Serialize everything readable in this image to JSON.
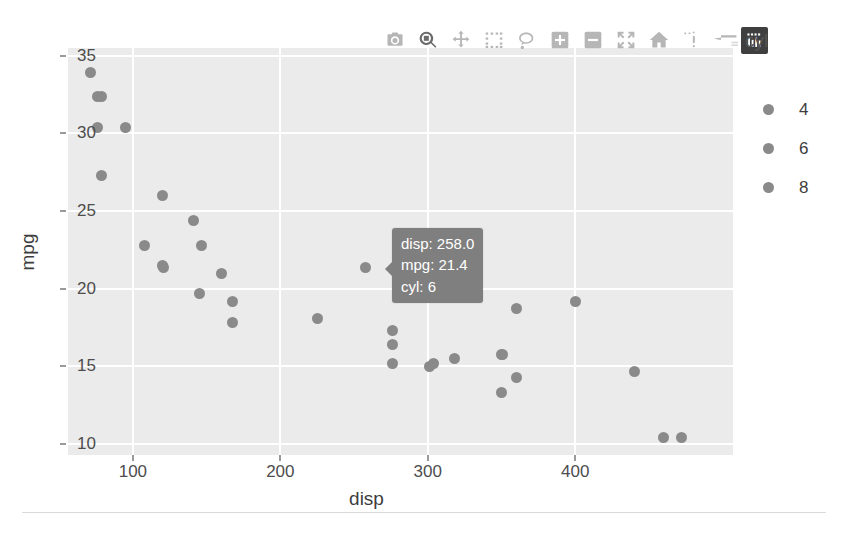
{
  "chart_data": {
    "type": "scatter",
    "title": "",
    "xlabel": "disp",
    "ylabel": "mpg",
    "xlim": [
      56.0,
      507.0
    ],
    "ylim": [
      9.3,
      35.5
    ],
    "xticks": [
      100,
      200,
      300,
      400
    ],
    "yticks": [
      10,
      15,
      20,
      25,
      30,
      35
    ],
    "grid": true,
    "legend_title": "cyl",
    "legend_position": "right",
    "legend_entries": [
      "4",
      "6",
      "8"
    ],
    "marker_color": "#8a8a8a",
    "plot_bg": "#ebebeb",
    "grid_color": "#ffffff",
    "series": [
      {
        "name": "4",
        "points": [
          {
            "disp": 71.1,
            "mpg": 33.9
          },
          {
            "disp": 75.7,
            "mpg": 32.4
          },
          {
            "disp": 78.7,
            "mpg": 32.4
          },
          {
            "disp": 79.0,
            "mpg": 27.3
          },
          {
            "disp": 95.1,
            "mpg": 30.4
          },
          {
            "disp": 120.1,
            "mpg": 21.5
          },
          {
            "disp": 120.3,
            "mpg": 26.0
          },
          {
            "disp": 121.0,
            "mpg": 21.4
          },
          {
            "disp": 140.8,
            "mpg": 24.4
          },
          {
            "disp": 146.7,
            "mpg": 22.8
          },
          {
            "disp": 108.0,
            "mpg": 22.8
          },
          {
            "disp": 75.7,
            "mpg": 30.4
          }
        ]
      },
      {
        "name": "6",
        "points": [
          {
            "disp": 160.0,
            "mpg": 21.0
          },
          {
            "disp": 167.6,
            "mpg": 19.2
          },
          {
            "disp": 167.6,
            "mpg": 17.8
          },
          {
            "disp": 145.0,
            "mpg": 19.7
          },
          {
            "disp": 225.0,
            "mpg": 18.1
          },
          {
            "disp": 258.0,
            "mpg": 21.4
          }
        ]
      },
      {
        "name": "8",
        "points": [
          {
            "disp": 275.8,
            "mpg": 17.3
          },
          {
            "disp": 275.8,
            "mpg": 16.4
          },
          {
            "disp": 275.8,
            "mpg": 15.2
          },
          {
            "disp": 301.0,
            "mpg": 15.0
          },
          {
            "disp": 304.0,
            "mpg": 15.2
          },
          {
            "disp": 318.0,
            "mpg": 15.5
          },
          {
            "disp": 350.0,
            "mpg": 15.8
          },
          {
            "disp": 351.0,
            "mpg": 15.8
          },
          {
            "disp": 350.0,
            "mpg": 13.3
          },
          {
            "disp": 360.0,
            "mpg": 14.3
          },
          {
            "disp": 360.0,
            "mpg": 18.7
          },
          {
            "disp": 400.0,
            "mpg": 19.2
          },
          {
            "disp": 440.0,
            "mpg": 14.7
          },
          {
            "disp": 460.0,
            "mpg": 10.4
          },
          {
            "disp": 472.0,
            "mpg": 10.4
          }
        ]
      }
    ]
  },
  "axis": {
    "x_title": "disp",
    "y_title": "mpg",
    "x_tick_labels": [
      "100",
      "200",
      "300",
      "400"
    ],
    "y_tick_labels": [
      "35",
      "30",
      "25",
      "20",
      "15",
      "10"
    ]
  },
  "legend": {
    "title": "cyl",
    "items": [
      {
        "label": "4"
      },
      {
        "label": "6"
      },
      {
        "label": "8"
      }
    ]
  },
  "tooltip": {
    "line1": "disp: 258.0",
    "line2": "mpg: 21.4",
    "line3": "cyl: 6"
  },
  "modebar": {
    "buttons": [
      {
        "name": "download-plot-as-png-icon",
        "tooltip": "Download plot as a png",
        "active": false,
        "style": "light"
      },
      {
        "name": "zoom-icon",
        "tooltip": "Zoom",
        "active": true,
        "style": "light"
      },
      {
        "name": "pan-icon",
        "tooltip": "Pan",
        "active": false,
        "style": "light"
      },
      {
        "name": "box-select-icon",
        "tooltip": "Box Select",
        "active": false,
        "style": "light"
      },
      {
        "name": "lasso-select-icon",
        "tooltip": "Lasso Select",
        "active": false,
        "style": "light"
      },
      {
        "name": "zoom-in-icon",
        "tooltip": "Zoom in",
        "active": false,
        "style": "light"
      },
      {
        "name": "zoom-out-icon",
        "tooltip": "Zoom out",
        "active": false,
        "style": "light"
      },
      {
        "name": "autoscale-icon",
        "tooltip": "Autoscale",
        "active": false,
        "style": "light"
      },
      {
        "name": "reset-axes-home-icon",
        "tooltip": "Reset axes",
        "active": false,
        "style": "light"
      },
      {
        "name": "toggle-spike-lines-icon",
        "tooltip": "Toggle Spike Lines",
        "active": false,
        "style": "light"
      },
      {
        "name": "hover-compare-data-icon",
        "tooltip": "Compare data on hover",
        "active": false,
        "style": "light"
      },
      {
        "name": "plotly-logo-icon",
        "tooltip": "Produced with Plotly",
        "active": false,
        "style": "dark"
      }
    ]
  }
}
